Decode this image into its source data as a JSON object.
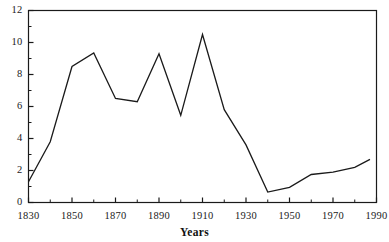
{
  "chart_data": {
    "type": "line",
    "title": "",
    "subtitle": "",
    "xlabel": "Years",
    "ylabel": "",
    "xlim": [
      1830,
      1990
    ],
    "ylim": [
      0,
      12
    ],
    "grid": false,
    "legend": false,
    "legend_position": "none",
    "x_ticks_major": [
      1830,
      1850,
      1870,
      1890,
      1910,
      1930,
      1950,
      1970,
      1990
    ],
    "x_tick_labels": [
      "1830",
      "1850",
      "1870",
      "1890",
      "1910",
      "1930",
      "1950",
      "1970",
      "1990"
    ],
    "x_ticks_minor": [
      1840,
      1860,
      1880,
      1900,
      1920,
      1940,
      1960,
      1980
    ],
    "y_ticks_major": [
      0,
      2,
      4,
      6,
      8,
      10,
      12
    ],
    "y_tick_labels": [
      "0",
      "2",
      "4",
      "6",
      "8",
      "10",
      "12"
    ],
    "y_ticks_minor": [
      1,
      3,
      5,
      7,
      9,
      11
    ],
    "line_color": "#1a1a1a",
    "axis_color": "#1a1a1a",
    "background_color": "#ffffff",
    "series": [
      {
        "name": "series-1",
        "x": [
          1830,
          1840,
          1850,
          1860,
          1870,
          1880,
          1890,
          1900,
          1910,
          1920,
          1930,
          1940,
          1950,
          1960,
          1970,
          1980,
          1987
        ],
        "values": [
          1.3,
          3.8,
          8.5,
          9.35,
          6.5,
          6.3,
          9.3,
          5.45,
          10.5,
          5.8,
          3.6,
          0.65,
          0.95,
          1.75,
          1.9,
          2.2,
          2.7
        ]
      }
    ]
  }
}
